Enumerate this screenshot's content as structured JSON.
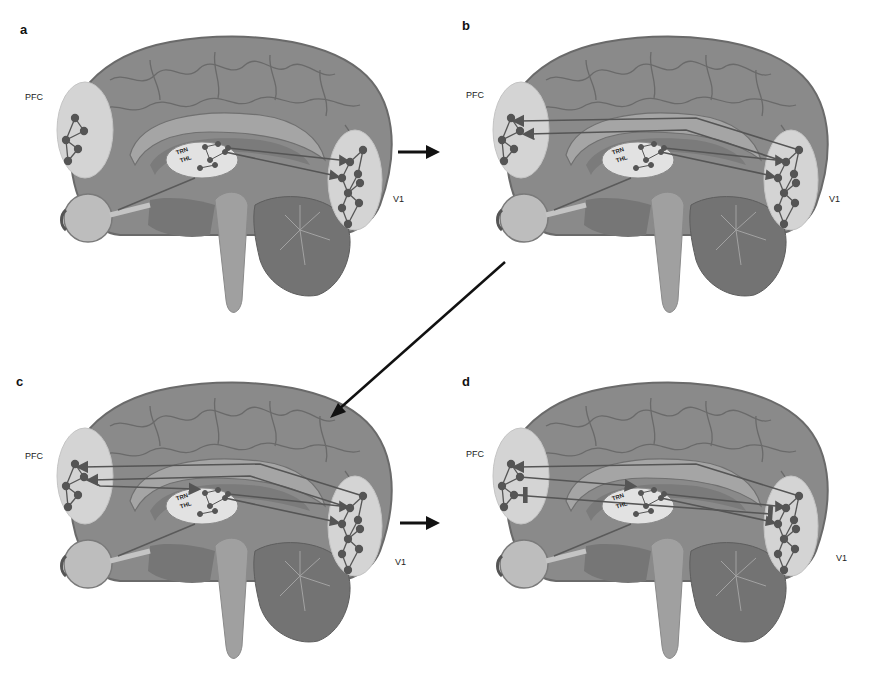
{
  "figure": {
    "panels": [
      {
        "id": "a",
        "letter": "a",
        "pfc_label": "PFC",
        "v1_label": "V1",
        "trn_label": "TRN",
        "thl_label": "THL",
        "connections": "thalamus-to-V1 feedforward"
      },
      {
        "id": "b",
        "letter": "b",
        "pfc_label": "PFC",
        "v1_label": "V1",
        "trn_label": "TRN",
        "thl_label": "THL",
        "connections": "V1-to-PFC feedforward added"
      },
      {
        "id": "c",
        "letter": "c",
        "pfc_label": "PFC",
        "v1_label": "V1",
        "trn_label": "TRN",
        "thl_label": "THL",
        "connections": "PFC-to-TRN feedback added"
      },
      {
        "id": "d",
        "letter": "d",
        "pfc_label": "PFC",
        "v1_label": "V1",
        "trn_label": "TRN",
        "thl_label": "THL",
        "connections": "PFC-to-V1 inhibitory feedback added"
      }
    ],
    "flow": [
      "a",
      "b",
      "c",
      "d"
    ],
    "colors": {
      "brain": "#8a8a8a",
      "brain_dark": "#6e6e6e",
      "region_highlight": "#d4d4d4",
      "node": "#555555",
      "edge": "#5a5a5a",
      "flow_arrow": "#111111",
      "background": "#ffffff"
    }
  }
}
